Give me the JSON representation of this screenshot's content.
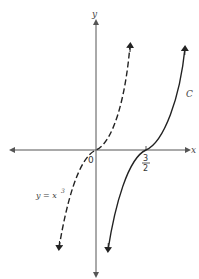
{
  "diagram": {
    "axes": {
      "x_label": "x",
      "y_label": "y",
      "origin_label": "0"
    },
    "curves": [
      {
        "name": "y = x^3",
        "label_main": "y = x",
        "label_exp": "3",
        "style": "dashed",
        "inflection_x": 0
      },
      {
        "name": "C",
        "label": "C",
        "style": "solid",
        "inflection_x": "3/2"
      }
    ],
    "tick_label": {
      "numerator": "3",
      "denominator": "2"
    },
    "colors": {
      "axis": "#555555",
      "curve": "#222222",
      "background": "#ffffff"
    }
  }
}
